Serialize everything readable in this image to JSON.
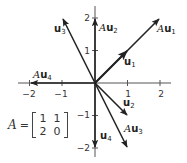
{
  "diagram": {
    "type": "vector-transformation",
    "axes": {
      "x_ticks": [
        {
          "value": -2,
          "label": "−2"
        },
        {
          "value": -1,
          "label": "−1"
        },
        {
          "value": 1,
          "label": "1"
        },
        {
          "value": 2,
          "label": "2"
        }
      ],
      "y_ticks": [
        {
          "value": 2,
          "label": "2"
        },
        {
          "value": 1,
          "label": "1"
        },
        {
          "value": -1,
          "label": "−1"
        },
        {
          "value": -2,
          "label": "−2"
        }
      ]
    },
    "vectors": [
      {
        "id": "u1",
        "prefix": "",
        "name": "u",
        "subscript": "1",
        "coords": [
          1,
          1
        ]
      },
      {
        "id": "Au1",
        "prefix": "A",
        "name": "u",
        "subscript": "1",
        "coords": [
          2,
          2
        ]
      },
      {
        "id": "u2",
        "prefix": "",
        "name": "u",
        "subscript": "2",
        "coords": [
          1,
          -1
        ]
      },
      {
        "id": "Au2",
        "prefix": "A",
        "name": "u",
        "subscript": "2",
        "coords": [
          0,
          2
        ]
      },
      {
        "id": "u3",
        "prefix": "",
        "name": "u",
        "subscript": "3",
        "coords": [
          -1,
          2
        ]
      },
      {
        "id": "Au3",
        "prefix": "A",
        "name": "u",
        "subscript": "3",
        "coords": [
          1,
          -2
        ]
      },
      {
        "id": "u4",
        "prefix": "",
        "name": "u",
        "subscript": "4",
        "coords": [
          0,
          -2
        ]
      },
      {
        "id": "Au4",
        "prefix": "A",
        "name": "u",
        "subscript": "4",
        "coords": [
          -2,
          0
        ]
      }
    ],
    "matrix": {
      "name": "A",
      "equals": "=",
      "rows": [
        [
          "1",
          "1"
        ],
        [
          "2",
          "0"
        ]
      ]
    }
  }
}
